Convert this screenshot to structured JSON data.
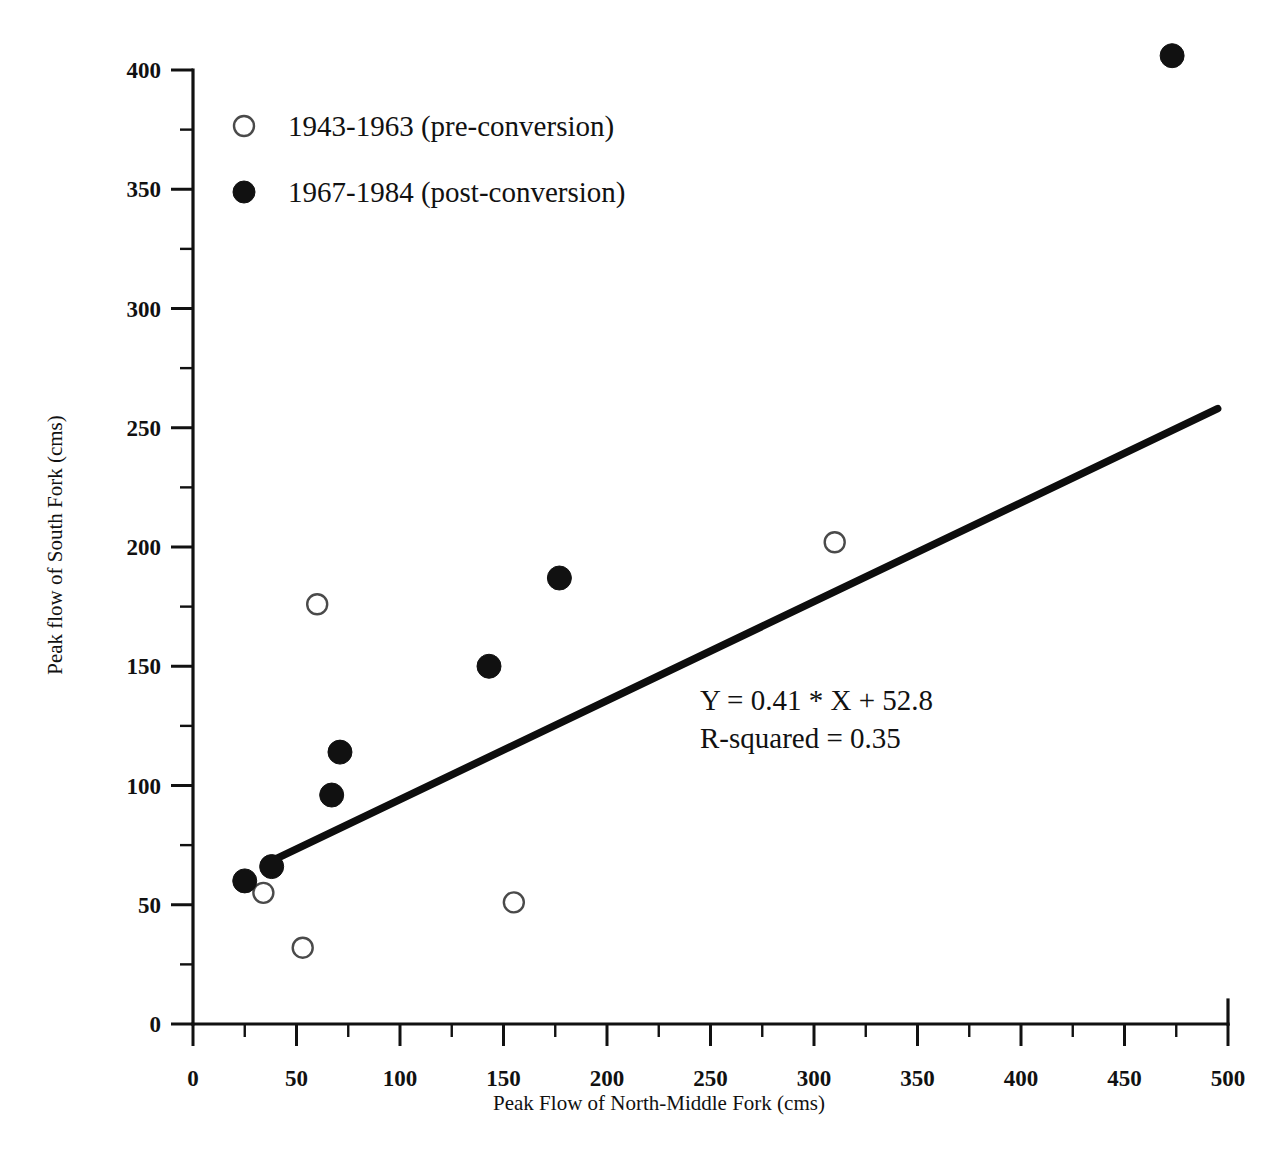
{
  "chart_data": {
    "type": "scatter",
    "title": "",
    "xlabel": "Peak Flow of North-Middle Fork (cms)",
    "ylabel": "Peak flow of South Fork (cms)",
    "xlim": [
      0,
      500
    ],
    "ylim": [
      0,
      400
    ],
    "xticks": [
      0,
      50,
      100,
      150,
      200,
      250,
      300,
      350,
      400,
      450,
      500
    ],
    "yticks": [
      0,
      50,
      100,
      150,
      200,
      250,
      300,
      350,
      400
    ],
    "xtick_labels": [
      "0",
      "50",
      "100",
      "150",
      "200",
      "250",
      "300",
      "350",
      "400",
      "450",
      "500"
    ],
    "ytick_labels": [
      "0",
      "50",
      "100",
      "150",
      "200",
      "250",
      "300",
      "350",
      "400"
    ],
    "x_minor_step": 25,
    "y_minor_step": 25,
    "grid": false,
    "legend_position": "top-left",
    "series": [
      {
        "name": "1943-1963 (pre-conversion)",
        "marker": "open-circle",
        "color": "#ffffff",
        "edge_color": "#4a4a4a",
        "points": [
          {
            "x": 34,
            "y": 55
          },
          {
            "x": 53,
            "y": 32
          },
          {
            "x": 60,
            "y": 176
          },
          {
            "x": 155,
            "y": 51
          },
          {
            "x": 310,
            "y": 202
          }
        ]
      },
      {
        "name": "1967-1984 (post-conversion)",
        "marker": "filled-circle",
        "color": "#111111",
        "edge_color": "#111111",
        "points": [
          {
            "x": 25,
            "y": 60
          },
          {
            "x": 38,
            "y": 66
          },
          {
            "x": 67,
            "y": 96
          },
          {
            "x": 71,
            "y": 114
          },
          {
            "x": 143,
            "y": 150
          },
          {
            "x": 177,
            "y": 187
          },
          {
            "x": 473,
            "y": 406
          }
        ]
      }
    ],
    "fit_line": {
      "equation_label": "Y = 0.41 * X + 52.8",
      "r_squared_label": "R-squared = 0.35",
      "slope": 0.41,
      "intercept": 52.8,
      "r_squared": 0.35,
      "x_start": 37,
      "x_end": 495,
      "y_start": 68,
      "y_end": 258
    },
    "annotations": [
      {
        "id": "equation",
        "text": "Y = 0.41 * X + 52.8"
      },
      {
        "id": "r-squared",
        "text": "R-squared = 0.35"
      }
    ]
  },
  "legend": {
    "items": [
      {
        "label": "1943-1963 (pre-conversion)",
        "marker": "open-circle"
      },
      {
        "label": "1967-1984 (post-conversion)",
        "marker": "filled-circle"
      }
    ]
  },
  "axes": {
    "x_title": "Peak Flow of North-Middle Fork (cms)",
    "y_title": "Peak flow of South Fork (cms)"
  }
}
